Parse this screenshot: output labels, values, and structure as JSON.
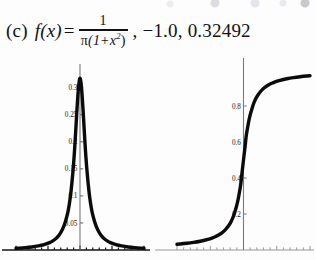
{
  "figure": {
    "caption_label": "(c)",
    "function_lhs": "f(x)",
    "equals": "=",
    "fraction_numerator": "1",
    "fraction_denominator_pi": "π",
    "fraction_denominator_rest": "(1+x",
    "fraction_denominator_exp": "2",
    "fraction_denominator_close": ")",
    "parameters_text": ", −1.0, 0.32492"
  },
  "chart_data": [
    {
      "type": "line",
      "name": "cauchy-pdf",
      "title": "",
      "xlabel": "",
      "ylabel": "",
      "xlim": [
        -10,
        10
      ],
      "ylim": [
        0,
        0.34
      ],
      "grid": false,
      "legend": "none",
      "axis_position": "x-axis at bottom, y-axis at x=0",
      "yticks": [
        0.05,
        0.1,
        0.15,
        0.2,
        0.25,
        0.3
      ],
      "ytick_labels": [
        "0.05",
        "0.1",
        "0.15",
        "0.2",
        "0.25",
        "0.3"
      ],
      "xticks": [
        -10,
        -9,
        -8,
        -7,
        -6,
        -5,
        -4,
        -3,
        -2,
        -1,
        0,
        1,
        2,
        3,
        4,
        5,
        6,
        7,
        8,
        9,
        10
      ],
      "xtick_labels": [],
      "annotation": "probability density 1/(pi(1+x^2)) peak 0.3183 at x=0",
      "x": [
        -10,
        -9,
        -8,
        -7,
        -6,
        -5,
        -4.5,
        -4,
        -3.5,
        -3,
        -2.5,
        -2,
        -1.75,
        -1.5,
        -1.25,
        -1,
        -0.85,
        -0.7,
        -0.55,
        -0.4,
        -0.25,
        -0.1,
        0,
        0.1,
        0.25,
        0.4,
        0.55,
        0.7,
        0.85,
        1,
        1.25,
        1.5,
        1.75,
        2,
        2.5,
        3,
        3.5,
        4,
        4.5,
        5,
        6,
        7,
        8,
        9,
        10
      ],
      "values": [
        0.00315,
        0.00388,
        0.0049,
        0.00637,
        0.0086,
        0.01224,
        0.01501,
        0.01872,
        0.02381,
        0.03183,
        0.04387,
        0.06366,
        0.07809,
        0.09793,
        0.12457,
        0.15915,
        0.18399,
        0.21359,
        0.24425,
        0.27417,
        0.29957,
        0.31518,
        0.31831,
        0.31518,
        0.29957,
        0.27417,
        0.24425,
        0.21359,
        0.18399,
        0.15915,
        0.12457,
        0.09793,
        0.07809,
        0.06366,
        0.04387,
        0.03183,
        0.02381,
        0.01872,
        0.01501,
        0.01224,
        0.0086,
        0.00637,
        0.0049,
        0.00388,
        0.00315
      ]
    },
    {
      "type": "line",
      "name": "cauchy-cdf",
      "title": "",
      "xlabel": "",
      "ylabel": "",
      "xlim": [
        -10,
        10
      ],
      "ylim": [
        0,
        1.0
      ],
      "grid": false,
      "legend": "none",
      "axis_position": "x-axis at bottom, y-axis at x=0",
      "yticks": [
        0.2,
        0.4,
        0.6,
        0.8
      ],
      "ytick_labels": [
        "0.2",
        "0.4",
        "0.6",
        "0.8"
      ],
      "xticks": [
        -10,
        -9,
        -8,
        -7,
        -6,
        -5,
        -4,
        -3,
        -2,
        -1,
        0,
        1,
        2,
        3,
        4,
        5,
        6,
        7,
        8,
        9,
        10
      ],
      "xtick_labels": [],
      "annotation": "cumulative distribution 0.5 + atan(x)/pi",
      "x": [
        -10,
        -9,
        -8,
        -7,
        -6,
        -5,
        -4.5,
        -4,
        -3.5,
        -3,
        -2.5,
        -2,
        -1.75,
        -1.5,
        -1.25,
        -1,
        -0.85,
        -0.7,
        -0.55,
        -0.4,
        -0.25,
        -0.1,
        0,
        0.1,
        0.25,
        0.4,
        0.55,
        0.7,
        0.85,
        1,
        1.25,
        1.5,
        1.75,
        2,
        2.5,
        3,
        3.5,
        4,
        4.5,
        5,
        6,
        7,
        8,
        9,
        10
      ],
      "values": [
        0.03173,
        0.0352,
        0.03952,
        0.04507,
        0.05251,
        0.06283,
        0.06976,
        0.07798,
        0.08819,
        0.10242,
        0.12111,
        0.14758,
        0.16683,
        0.18717,
        0.21729,
        0.25,
        0.27349,
        0.30278,
        0.33391,
        0.36702,
        0.42202,
        0.46824,
        0.5,
        0.53176,
        0.57798,
        0.63298,
        0.66609,
        0.69722,
        0.72651,
        0.75,
        0.78271,
        0.81283,
        0.83317,
        0.85242,
        0.87889,
        0.89758,
        0.91181,
        0.92202,
        0.93024,
        0.93717,
        0.94749,
        0.95493,
        0.96048,
        0.9648,
        0.96827
      ]
    }
  ]
}
